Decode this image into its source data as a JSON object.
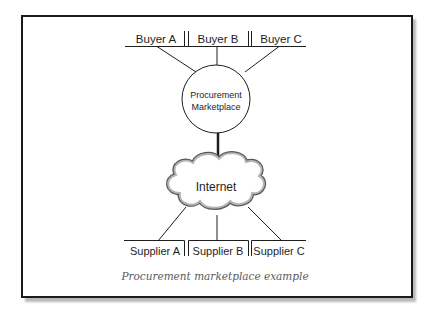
{
  "diagram": {
    "type": "network-topology",
    "hub": {
      "label_line1": "Procurement",
      "label_line2": "Marketplace",
      "shape": "ellipse"
    },
    "network": {
      "label": "Internet",
      "shape": "cloud"
    },
    "buyers": [
      {
        "label": "Buyer A"
      },
      {
        "label": "Buyer B"
      },
      {
        "label": "Buyer C"
      }
    ],
    "suppliers": [
      {
        "label": "Supplier A"
      },
      {
        "label": "Supplier B"
      },
      {
        "label": "Supplier C"
      }
    ],
    "edges": [
      {
        "from": "Buyer A",
        "to": "Procurement Marketplace"
      },
      {
        "from": "Buyer B",
        "to": "Procurement Marketplace"
      },
      {
        "from": "Buyer C",
        "to": "Procurement Marketplace"
      },
      {
        "from": "Procurement Marketplace",
        "to": "Internet",
        "style": "thick"
      },
      {
        "from": "Internet",
        "to": "Supplier A"
      },
      {
        "from": "Internet",
        "to": "Supplier B"
      },
      {
        "from": "Internet",
        "to": "Supplier C"
      }
    ],
    "caption": "Procurement marketplace example"
  },
  "colors": {
    "line": "#1e1e1e",
    "cloud_fill": "#9a9a9a",
    "caption": "#5a5a5a",
    "shadow": "#b8b8b8"
  }
}
